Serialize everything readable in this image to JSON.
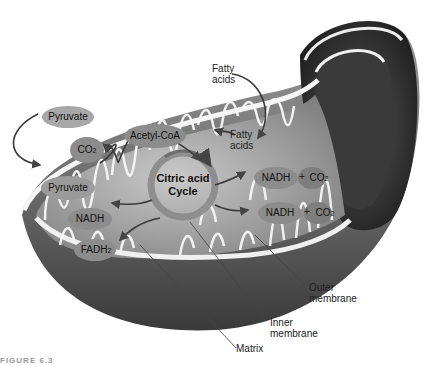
{
  "diagram": {
    "center_label": [
      "Citric acid",
      "Cycle"
    ],
    "molecules": {
      "pyruvate_outside": "Pyruvate",
      "pyruvate_inside": "Pyruvate",
      "co2_left": "CO",
      "co2_left_sub": "2",
      "acetyl_coa": "Acetyl-CoA",
      "nadh_left": "NADH",
      "fadh2": "FADH",
      "fadh2_sub": "2",
      "nadh_right_1": "NADH",
      "nadh_right_2": "NADH",
      "plus_1": "+",
      "plus_2": "+",
      "co2_right_1": "CO",
      "co2_right_1_sub": "2",
      "co2_right_2": "CO",
      "co2_right_2_sub": "2"
    },
    "labels": {
      "fatty_acids_outside": [
        "Fatty",
        "acids"
      ],
      "fatty_acids_inside": [
        "Fatty",
        "acids"
      ],
      "outer_membrane": [
        "Outer",
        "membrane"
      ],
      "inner_membrane": [
        "Inner",
        "membrane"
      ],
      "matrix": "Matrix"
    },
    "figure_caption_partial": "FIGURE 6.3"
  }
}
